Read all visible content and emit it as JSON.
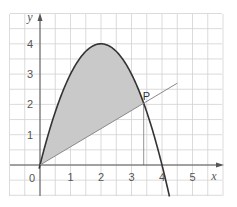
{
  "chart_data": {
    "type": "line",
    "title": "",
    "xlabel": "x",
    "ylabel": "y",
    "xlim": [
      -1,
      6
    ],
    "ylim": [
      -1,
      5
    ],
    "grid": true,
    "grid_minor_step": 0.5,
    "x_ticks": [
      "0",
      "1",
      "2",
      "3",
      "4",
      "5"
    ],
    "y_ticks": [
      "1",
      "2",
      "3",
      "4"
    ],
    "origin_label": "0",
    "series": [
      {
        "name": "curve",
        "equation": "y = 4x - x^2",
        "x": [
          0,
          0.5,
          1,
          1.5,
          2,
          2.5,
          3,
          3.5,
          4,
          4.25
        ],
        "y": [
          0,
          1.75,
          3,
          3.75,
          4,
          3.75,
          3,
          1.75,
          0,
          -1.06
        ]
      },
      {
        "name": "line",
        "x": [
          0,
          4.5
        ],
        "y": [
          0,
          2.7
        ]
      }
    ],
    "shaded_region": "between curve and line from x=0 to x=3.4",
    "annotations": [
      {
        "label": "P",
        "x": 3.4,
        "y": 2.04,
        "dropline_to_x_axis": true
      }
    ]
  },
  "colors": {
    "grid": "#d2d2d2",
    "axis": "#555555",
    "curve": "#333333",
    "line": "#8a8a8a",
    "shade": "#c9c9c9"
  }
}
